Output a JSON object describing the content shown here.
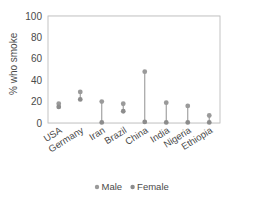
{
  "chart_data": {
    "type": "scatter",
    "title": "",
    "xlabel": "",
    "ylabel": "% who smoke",
    "ylim": [
      0,
      100
    ],
    "yticks": [
      0,
      20,
      40,
      60,
      80,
      100
    ],
    "ytick_labels": [
      "0",
      "20",
      "40",
      "60",
      "80",
      "100"
    ],
    "grid": true,
    "legend_position": "bottom",
    "categories": [
      "USA",
      "Germany",
      "Iran",
      "Brazil",
      "China",
      "India",
      "Nigeria",
      "Ethiopia"
    ],
    "series": [
      {
        "name": "Male",
        "color": "#9a9a9a",
        "values": [
          18,
          29,
          20,
          18,
          48,
          19,
          16,
          7
        ]
      },
      {
        "name": "Female",
        "color": "#8c8c8c",
        "values": [
          15,
          22,
          0.5,
          11,
          1,
          0.5,
          0.5,
          0.5
        ]
      }
    ],
    "connector_color": "#9a9a9a",
    "plot_border_color": "#bdbdbd",
    "gridline_color": "#ececec",
    "text_color": "#4a4a4a"
  },
  "legend": {
    "items": [
      {
        "label": "Male",
        "marker": "dot-marker",
        "color": "#9a9a9a"
      },
      {
        "label": "Female",
        "marker": "dot-marker",
        "color": "#8c8c8c"
      }
    ]
  }
}
